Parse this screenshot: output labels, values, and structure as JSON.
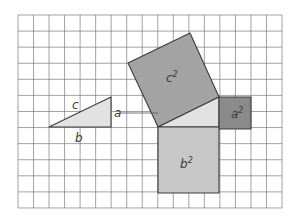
{
  "diagram": {
    "type": "pythagorean-theorem-grid",
    "grid": {
      "x0": 18,
      "y0": 15,
      "cols": 17,
      "rows": 12,
      "cell_w": 15.53,
      "cell_h": 16.08,
      "line_color": "#7a7a7a",
      "border_color": "#888888"
    },
    "colors": {
      "triangle_fill": "#e2e2e2",
      "c_square_fill": "#a3a3a3",
      "a_square_fill": "#8a8a8a",
      "b_square_fill": "#c7c7c7",
      "outline": "#3c3c3c"
    },
    "labels": {
      "c": "c",
      "a": "a",
      "b": "b",
      "c_squared_base": "c",
      "a_squared_base": "a",
      "b_squared_base": "b",
      "exponent": "2"
    },
    "shapes": {
      "small_triangle": "49,127 111,97 111,127",
      "c_square": "128,63 190,33 219,97 158,127",
      "a_square": "219,97 251,97 251,129 219,129",
      "b_square": "158,127 219,127 219,193 158,193",
      "inner_triangle": "158,127 219,97 219,127"
    }
  }
}
